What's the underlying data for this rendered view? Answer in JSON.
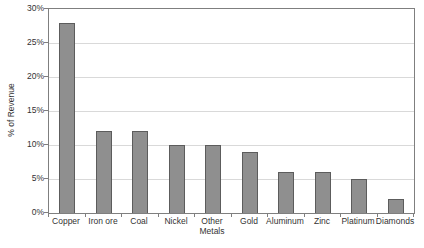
{
  "chart_data": {
    "type": "bar",
    "title": "",
    "categories": [
      "Copper",
      "Iron ore",
      "Coal",
      "Nickel",
      "Other Metals",
      "Gold",
      "Aluminum",
      "Zinc",
      "Platinum",
      "Diamonds"
    ],
    "values": [
      28,
      12,
      12,
      10,
      10,
      9,
      6,
      6,
      5,
      2
    ],
    "xlabel": "",
    "ylabel": "% of Revenue",
    "ylim": [
      0,
      30
    ],
    "ytick_step": 5,
    "ytick_labels": [
      "0%",
      "5%",
      "10%",
      "15%",
      "20%",
      "25%",
      "30%"
    ],
    "grid": true,
    "legend_position": "none",
    "colors": {
      "bar_fill": "#8f8f8f",
      "bar_border": "#5c5c5c",
      "gridline": "#d9d9d9",
      "axis": "#7f7f7f",
      "text": "#333333",
      "background": "#ffffff"
    }
  }
}
